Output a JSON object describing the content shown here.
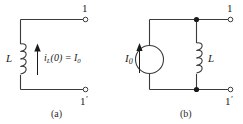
{
  "figure": {
    "type": "circuit-diagram",
    "line_color": "#3a3a3a",
    "text_color": "#1a1a1a",
    "background": "#ffffff"
  },
  "panel_a": {
    "caption": "(a)",
    "inductor_label": "L",
    "inductor_turns": 4,
    "current_label_main": "i",
    "current_label_sub": "L",
    "current_label_rest": "(0)  =  I",
    "current_label_rest_sub": "0",
    "current_arrow_direction": "up",
    "terminal_top_label": "1",
    "terminal_bottom_label": "1",
    "terminal_bottom_prime": "′"
  },
  "panel_b": {
    "caption": "(b)",
    "source_label": "I",
    "source_label_sub": "0",
    "source_type": "current-source-circle",
    "source_arrow_direction": "up",
    "inductor_label": "L",
    "inductor_turns": 4,
    "terminal_top_label": "1",
    "terminal_bottom_label": "1",
    "terminal_bottom_prime": "′",
    "node_dots": 2
  }
}
